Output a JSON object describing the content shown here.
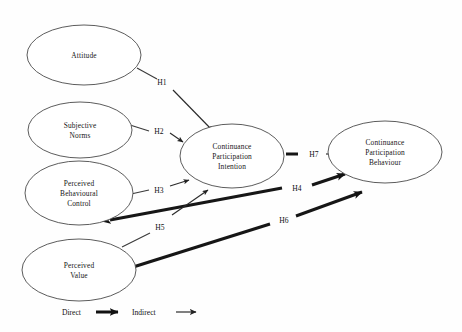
{
  "diagram": {
    "nodes": [
      {
        "id": "attitude",
        "label_lines": [
          "Attitude"
        ],
        "cx": 84,
        "cy": 55,
        "rx": 57,
        "ry": 30
      },
      {
        "id": "subjective-norms",
        "label_lines": [
          "Subjective",
          "Norms"
        ],
        "cx": 80,
        "cy": 130,
        "rx": 52,
        "ry": 28
      },
      {
        "id": "perceived-behavioural-control",
        "label_lines": [
          "Perceived",
          "Behavioural",
          "Control"
        ],
        "cx": 79,
        "cy": 193,
        "rx": 54,
        "ry": 32
      },
      {
        "id": "perceived-value",
        "label_lines": [
          "Perceived",
          "Value"
        ],
        "cx": 79,
        "cy": 270,
        "rx": 57,
        "ry": 31
      },
      {
        "id": "continuance-participation-intention",
        "label_lines": [
          "Continuance",
          "Participation",
          "Intention"
        ],
        "cx": 232,
        "cy": 156,
        "rx": 52,
        "ry": 32
      },
      {
        "id": "continuance-participation-behaviour",
        "label_lines": [
          "Continuance",
          "Participation",
          "Behaviour"
        ],
        "cx": 385,
        "cy": 152,
        "rx": 57,
        "ry": 31
      }
    ],
    "hypotheses": [
      {
        "id": "H1",
        "label": "H1",
        "x": 162,
        "y": 82,
        "type": "indirect",
        "from": "attitude",
        "to": "continuance-participation-intention"
      },
      {
        "id": "H2",
        "label": "H2",
        "x": 159,
        "y": 131,
        "type": "indirect",
        "from": "subjective-norms",
        "to": "continuance-participation-intention"
      },
      {
        "id": "H3",
        "label": "H3",
        "x": 159,
        "y": 190,
        "type": "indirect",
        "from": "perceived-behavioural-control",
        "to": "continuance-participation-intention"
      },
      {
        "id": "H4",
        "label": "H4",
        "x": 297,
        "y": 188,
        "type": "direct",
        "from": "perceived-behavioural-control",
        "to": "continuance-participation-behaviour"
      },
      {
        "id": "H5",
        "label": "H5",
        "x": 160,
        "y": 227,
        "type": "indirect",
        "from": "perceived-value",
        "to": "continuance-participation-intention"
      },
      {
        "id": "H6",
        "label": "H6",
        "x": 284,
        "y": 220,
        "type": "direct",
        "from": "perceived-value",
        "to": "continuance-participation-behaviour"
      },
      {
        "id": "H7",
        "label": "H7",
        "x": 317,
        "y": 155,
        "type": "indirect",
        "from": "continuance-participation-intention",
        "to": "continuance-participation-behaviour"
      }
    ],
    "legend": {
      "direct_label": "Direct",
      "indirect_label": "Indirect"
    }
  }
}
